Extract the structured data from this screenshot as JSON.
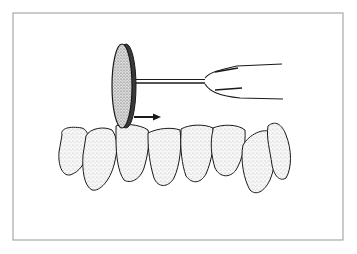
{
  "canvas": {
    "width": 357,
    "height": 254,
    "background": "#ffffff"
  },
  "frame": {
    "x": 13,
    "y": 13,
    "width": 330,
    "height": 227,
    "stroke": "#a8a8a8",
    "stroke_width": 1.2
  },
  "colors": {
    "ink": "#1a1a1a",
    "stipple": "#6e6e6e",
    "tooth_fill": "#f4f4f4",
    "disc_fill": "#d8d8d8",
    "disc_dark": "#3a3a3a"
  },
  "illustration": {
    "subject": "separating disc on mandrel polishing lower anterior teeth",
    "direction_arrow": {
      "x1": 134,
      "y1": 117,
      "x2": 161,
      "y2": 117
    },
    "disc": {
      "cx": 122,
      "cy": 86,
      "rx": 10,
      "ry": 42
    },
    "mandrel": {
      "x1": 130,
      "y1": 81,
      "x2": 205,
      "y2": 81
    },
    "handpiece_lines": [
      {
        "d": "M205,78 C210,72 220,70 237,66 L282,64"
      },
      {
        "d": "M205,84 C210,92 220,96 240,98 L283,99"
      },
      {
        "d": "M215,72 L238,68"
      },
      {
        "d": "M215,90 L242,88"
      }
    ],
    "teeth": [
      {
        "name": "left-canine",
        "d": "M62,135 C60,128 70,126 82,128 C88,130 90,138 88,150 C86,162 80,172 70,175 C62,176 58,165 59,152 Z"
      },
      {
        "name": "left-lateral",
        "d": "M86,136 C90,128 104,126 112,130 C118,138 118,150 114,165 C110,180 100,192 92,190 C84,186 82,170 83,155 Z"
      },
      {
        "name": "left-central-1",
        "d": "M116,126 C120,123 140,124 148,130 C150,140 148,155 144,168 C140,180 130,184 124,180 C118,172 116,155 116,140 Z"
      },
      {
        "name": "left-central-2",
        "d": "M148,133 C158,128 172,127 180,130 C182,145 180,165 174,178 C168,188 158,188 154,178 C150,165 148,150 148,138 Z"
      },
      {
        "name": "right-central-1",
        "d": "M181,129 C190,124 205,124 213,128 C215,142 212,160 206,174 C200,184 192,184 186,176 C182,165 180,148 181,134 Z"
      },
      {
        "name": "right-central-2",
        "d": "M213,128 C222,124 238,124 245,130 C246,145 242,160 236,170 C230,178 220,178 215,168 C211,155 210,142 213,130 Z"
      },
      {
        "name": "right-lateral",
        "d": "M243,145 C250,134 262,128 272,132 C278,145 276,165 270,180 C264,192 256,196 250,190 C244,180 240,160 243,145 Z"
      },
      {
        "name": "right-canine",
        "d": "M268,126 C275,120 282,124 286,135 C292,150 292,168 286,178 C280,182 274,176 272,165 C270,150 266,138 268,126 Z"
      }
    ]
  }
}
